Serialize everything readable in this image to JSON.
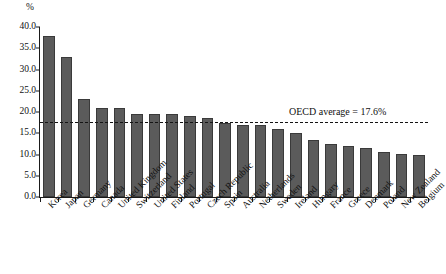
{
  "chart_data": {
    "type": "bar",
    "title": "",
    "subtitle": "",
    "xlabel": "",
    "ylabel": "%",
    "unit_label": "%",
    "ylim": [
      0,
      40
    ],
    "ytick_step": 5,
    "ytick_labels": [
      "0.0",
      "5.0",
      "10.0",
      "15.0",
      "20.0",
      "25.0",
      "30.0",
      "35.0",
      "40.0"
    ],
    "ytick_values": [
      0,
      5,
      10,
      15,
      20,
      25,
      30,
      35,
      40
    ],
    "grid": false,
    "legend": "none",
    "bar_color": "#5b5b5b",
    "bar_edge_color": "#3a3a3a",
    "categories": [
      "Korea",
      "Japan",
      "Germany",
      "Canada",
      "United Kingdom",
      "Switzerland",
      "United States",
      "Finland",
      "Portugal",
      "Czech Republic",
      "Spain",
      "Australia",
      "Netherlands",
      "Sweden",
      "Ireland",
      "Hungary",
      "France",
      "Greece",
      "Denmark",
      "Poland",
      "New Zealand",
      "Belgium"
    ],
    "values": [
      38.0,
      33.0,
      23.0,
      21.0,
      21.0,
      19.5,
      19.5,
      19.5,
      19.0,
      18.5,
      17.5,
      17.0,
      17.0,
      16.0,
      15.0,
      13.5,
      12.5,
      12.0,
      11.5,
      10.5,
      10.2,
      9.8
    ],
    "annotations": [
      {
        "name": "oecd-average",
        "label": "OECD average = 17.6%",
        "value": 17.6,
        "style": "dashed-horizontal-line"
      }
    ]
  }
}
